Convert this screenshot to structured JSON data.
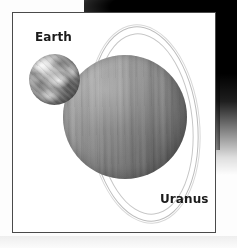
{
  "figure": {
    "kind": "astronomy-size-comparison-illustration",
    "medium": "grayscale-print-scan",
    "background_color": "#fdfdfd",
    "frame": {
      "name": "illustration-border",
      "color": "#4a4a4a",
      "left": 12,
      "top": 12,
      "width": 204,
      "height": 221
    },
    "scan_artifacts": [
      {
        "name": "top-edge-shadow",
        "color": "#000000",
        "position": "top-right"
      },
      {
        "name": "right-edge-shadow",
        "color": "#000000",
        "position": "right"
      }
    ],
    "bodies": [
      {
        "name": "earth",
        "label": "Earth",
        "surface_color": "#b9b9b9",
        "appearance": "mottled cloud-and-continent texture, grayscale",
        "relative_size": "small",
        "center_x": 42,
        "center_y": 79,
        "diameter": 51
      },
      {
        "name": "uranus",
        "label": "Uranus",
        "surface_color": "#939393",
        "appearance": "smooth sphere with faint vertical cloud banding",
        "relative_size": "large",
        "center_x": 124,
        "center_y": 116,
        "diameter": 124,
        "rings": {
          "name": "uranian-rings",
          "count": 2,
          "color": "#bcbcbc",
          "orientation": "near-vertical, tilted about -6 degrees"
        }
      }
    ],
    "labels": {
      "earth": "Earth",
      "uranus": "Uranus",
      "text_color": "#1b1b1b"
    }
  }
}
